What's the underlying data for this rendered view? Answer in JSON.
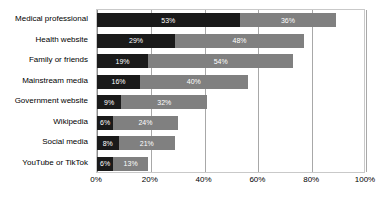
{
  "chart_data": {
    "type": "bar",
    "orientation": "horizontal",
    "stacked": true,
    "title": "",
    "subtitle": "",
    "xlabel": "",
    "ylabel": "",
    "xlim": [
      0,
      100
    ],
    "xticks": [
      "0%",
      "20%",
      "40%",
      "60%",
      "80%",
      "100%"
    ],
    "xtick_values": [
      0,
      20,
      40,
      60,
      80,
      100
    ],
    "grid": "vertical",
    "legend": "none",
    "categories": [
      "Medical professional",
      "Health website",
      "Family or friends",
      "Mainstream media",
      "Government website",
      "Wikipedia",
      "Social media",
      "YouTube or TikTok"
    ],
    "series": [
      {
        "name": "series-1",
        "color": "#1a1a1a",
        "values": [
          53,
          29,
          19,
          16,
          9,
          6,
          8,
          6
        ],
        "labels": [
          "53%",
          "29%",
          "19%",
          "16%",
          "9%",
          "6%",
          "8%",
          "6%"
        ]
      },
      {
        "name": "series-2",
        "color": "#808080",
        "values": [
          36,
          48,
          54,
          40,
          32,
          24,
          21,
          13
        ],
        "labels": [
          "36%",
          "48%",
          "54%",
          "40%",
          "32%",
          "24%",
          "21%",
          "13%"
        ]
      }
    ],
    "totals": [
      89,
      77,
      73,
      56,
      41,
      30,
      29,
      19
    ],
    "colors": {
      "segment_dark": "#1a1a1a",
      "segment_gray": "#808080",
      "gridline": "#a8a8a8",
      "plot_border": "#c9c9c9",
      "background": "#ffffff",
      "label_text": "#000000",
      "value_text": "#ffffff"
    }
  }
}
